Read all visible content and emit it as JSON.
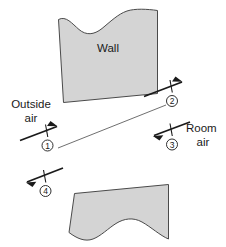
{
  "figure": {
    "title": "Wall with outside air and room air flow stations",
    "wall_label": "Wall",
    "labels": {
      "outside_line1": "Outside",
      "outside_line2": "air",
      "room_line1": "Room",
      "room_line2": "air"
    },
    "stations": [
      {
        "id": "1",
        "number": "1",
        "direction": "right",
        "side": "outside",
        "label": "Outside air"
      },
      {
        "id": "2",
        "number": "2",
        "direction": "right",
        "side": "outside",
        "label": ""
      },
      {
        "id": "3",
        "number": "3",
        "direction": "left",
        "side": "room",
        "label": "Room air"
      },
      {
        "id": "4",
        "number": "4",
        "direction": "left",
        "side": "room",
        "label": ""
      }
    ],
    "colors": {
      "wall_fill": "#d4d4d4",
      "wall_stroke": "#4a4a4a",
      "arrow": "#1a1a1a",
      "background": "#ffffff",
      "thin_line": "#4a4a4a"
    }
  }
}
